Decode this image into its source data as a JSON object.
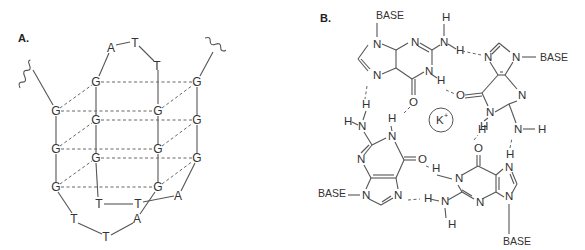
{
  "panels": {
    "a": {
      "label": "A.",
      "loop_top": [
        "A",
        "T",
        "T"
      ],
      "back_plane": [
        "G",
        "G",
        "G",
        "G",
        "G",
        "G"
      ],
      "front_plane": [
        "G",
        "G",
        "G",
        "G",
        "G",
        "G"
      ],
      "loop_bottom": [
        "T",
        "T",
        "A",
        "T",
        "T",
        "A"
      ]
    },
    "b": {
      "label": "B.",
      "ion": "K",
      "ion_charge": "+",
      "base_label": "BASE",
      "atoms": {
        "N": "N",
        "H": "H",
        "O": "O"
      }
    }
  }
}
